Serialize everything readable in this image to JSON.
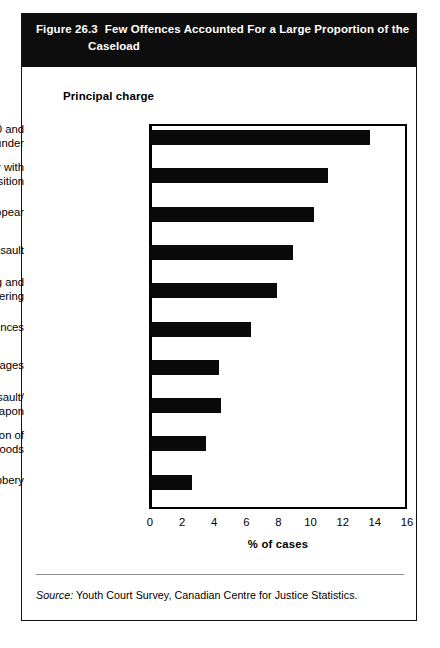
{
  "figure": {
    "number": "Figure 26.3",
    "title_line1": "Few Offences Accounted For a Large Proportion of the",
    "title_line2": "Caseload",
    "axis_caption": "Principal charge",
    "source_label": "Source:",
    "source_text": "Youth Court Survey, Canadian Centre for Justice Statistics."
  },
  "chart_data": {
    "type": "bar",
    "orientation": "horizontal",
    "xlabel": "% of cases",
    "ylabel": "Principal charge",
    "xlim": [
      0,
      16
    ],
    "xticks": [
      0,
      2,
      4,
      6,
      8,
      10,
      12,
      14,
      16
    ],
    "xtick_labels": [
      "0",
      "2",
      "4",
      "6",
      "8",
      "10",
      "12",
      "14",
      "16"
    ],
    "grid": false,
    "legend": false,
    "bar_color": "#0a0a0a",
    "categories": [
      "Theft $5,000 and\nunder",
      "Failure to comply with\na disposition",
      "Failure to appear",
      "Minor assault",
      "Breaking and\nentering",
      "Drug-related offences",
      "Mischief/damages",
      "Aggrav. assault/\nweapon",
      "Possession of\nstolen goods",
      "Robbery"
    ],
    "values": [
      13.7,
      11.1,
      10.2,
      8.9,
      7.9,
      6.3,
      4.3,
      4.4,
      3.5,
      2.6
    ]
  }
}
